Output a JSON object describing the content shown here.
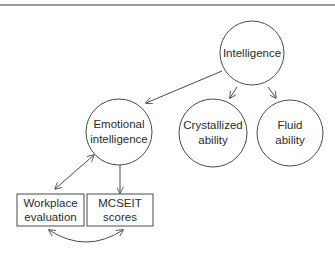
{
  "diagram": {
    "type": "hierarchy",
    "nodes": {
      "intelligence": {
        "shape": "circle",
        "line1": "Intelligence",
        "line2": ""
      },
      "emotional": {
        "shape": "circle",
        "line1": "Emotional",
        "line2": "intelligence"
      },
      "crystallized": {
        "shape": "circle",
        "line1": "Crystallized",
        "line2": "ability"
      },
      "fluid": {
        "shape": "circle",
        "line1": "Fluid",
        "line2": "ability"
      },
      "workplace": {
        "shape": "box",
        "line1": "Workplace",
        "line2": "evaluation"
      },
      "mcseit": {
        "shape": "box",
        "line1": "MCSEIT",
        "line2": "scores"
      }
    },
    "edges": [
      {
        "from": "Intelligence",
        "to": "Emotional intelligence",
        "direction": "forward"
      },
      {
        "from": "Intelligence",
        "to": "Crystallized ability",
        "direction": "forward"
      },
      {
        "from": "Intelligence",
        "to": "Fluid ability",
        "direction": "forward"
      },
      {
        "from": "Emotional intelligence",
        "to": "Workplace evaluation",
        "direction": "both"
      },
      {
        "from": "Emotional intelligence",
        "to": "MCSEIT scores",
        "direction": "forward"
      },
      {
        "from": "Workplace evaluation",
        "to": "MCSEIT scores",
        "direction": "both",
        "style": "curved"
      }
    ],
    "colors": {
      "stroke": "#4a4a4a",
      "text": "#2b2b2b",
      "rule": "#7a7a7a"
    }
  }
}
